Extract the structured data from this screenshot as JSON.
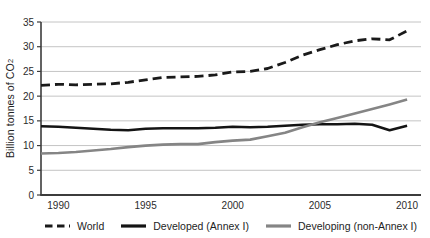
{
  "chart_data": {
    "type": "line",
    "title": "",
    "xlabel": "",
    "ylabel": "Billion tonnes of CO2",
    "ylabel_main": "Billion tonnes of CO",
    "ylabel_sub": "2",
    "xlim": [
      1989,
      2010.8
    ],
    "ylim": [
      0,
      35
    ],
    "x_ticks": [
      1990,
      1995,
      2000,
      2005,
      2010
    ],
    "y_ticks": [
      0,
      5,
      10,
      15,
      20,
      25,
      30,
      35
    ],
    "grid": "horizontal",
    "legend_position": "bottom",
    "years": [
      1989,
      1990,
      1991,
      1992,
      1993,
      1994,
      1995,
      1996,
      1997,
      1998,
      1999,
      2000,
      2001,
      2002,
      2003,
      2004,
      2005,
      2006,
      2007,
      2008,
      2009,
      2010
    ],
    "series": [
      {
        "name": "World",
        "slug": "world",
        "style": "dashed",
        "color": "#1a1a1a",
        "values": [
          22.2,
          22.4,
          22.3,
          22.4,
          22.5,
          22.8,
          23.3,
          23.8,
          23.9,
          24.0,
          24.3,
          24.9,
          25.0,
          25.6,
          26.8,
          28.3,
          29.4,
          30.4,
          31.2,
          31.6,
          31.4,
          33.2
        ]
      },
      {
        "name": "Developed (Annex I)",
        "slug": "developed-annex-i",
        "style": "solid",
        "color": "#141414",
        "values": [
          13.9,
          13.8,
          13.6,
          13.4,
          13.2,
          13.1,
          13.4,
          13.5,
          13.5,
          13.5,
          13.6,
          13.8,
          13.7,
          13.8,
          14.0,
          14.2,
          14.3,
          14.3,
          14.4,
          14.2,
          13.1,
          14.0
        ]
      },
      {
        "name": "Developing (non-Annex I)",
        "slug": "developing-non-annex-i",
        "style": "solid",
        "color": "#858585",
        "values": [
          8.4,
          8.5,
          8.7,
          9.0,
          9.3,
          9.7,
          10.0,
          10.2,
          10.3,
          10.3,
          10.7,
          11.0,
          11.2,
          11.9,
          12.6,
          13.7,
          14.7,
          15.6,
          16.5,
          17.4,
          18.3,
          19.3
        ]
      }
    ]
  },
  "colors": {
    "gridline": "#c4c4c4",
    "axis": "#3c3c3c",
    "text": "#2b2b2b"
  }
}
